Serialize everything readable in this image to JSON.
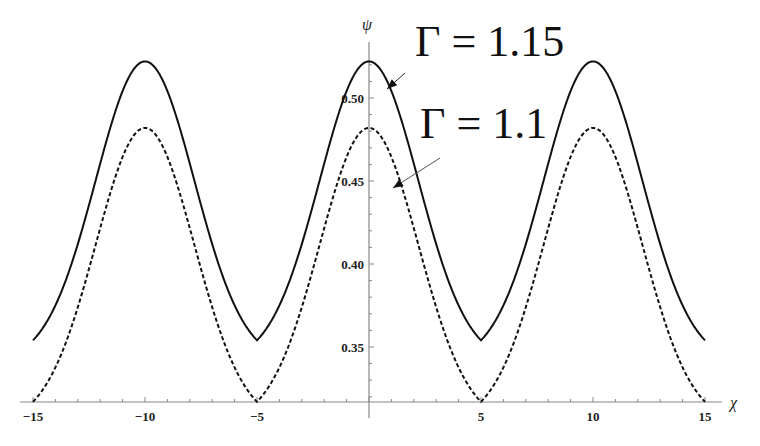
{
  "chart_data": {
    "type": "line",
    "title": "",
    "xlabel": "χ",
    "ylabel": "ψ",
    "xlim": [
      -15,
      15
    ],
    "ylim": [
      0.317,
      0.525
    ],
    "x_ticks": [
      -15,
      -10,
      -5,
      5,
      10,
      15
    ],
    "x_tick_labels": [
      "−15",
      "−10",
      "−5",
      "5",
      "10",
      "15"
    ],
    "y_ticks": [
      0.35,
      0.4,
      0.45,
      0.5
    ],
    "y_tick_labels": [
      "0.35",
      "0.40",
      "0.45",
      "0.50"
    ],
    "grid": false,
    "legend": "none (inline annotations with arrows)",
    "series": [
      {
        "name": "Γ = 1.15",
        "style": "solid",
        "period": 10,
        "peaks_at": [
          -10,
          0,
          10
        ],
        "troughs_at": [
          -15,
          -5,
          5,
          15
        ],
        "max": 0.522,
        "min": 0.354,
        "x": [
          -15,
          -12.5,
          -10,
          -7.5,
          -5,
          -2.5,
          0,
          2.5,
          5,
          7.5,
          10,
          12.5,
          15
        ],
        "values": [
          0.354,
          0.42,
          0.522,
          0.42,
          0.354,
          0.42,
          0.522,
          0.42,
          0.354,
          0.42,
          0.522,
          0.42,
          0.354
        ]
      },
      {
        "name": "Γ = 1.1",
        "style": "dashed",
        "period": 10,
        "peaks_at": [
          -10,
          0,
          10
        ],
        "troughs_at": [
          -15,
          -5,
          5,
          15
        ],
        "max": 0.482,
        "min": 0.317,
        "x": [
          -15,
          -12.5,
          -10,
          -7.5,
          -5,
          -2.5,
          0,
          2.5,
          5,
          7.5,
          10,
          12.5,
          15
        ],
        "values": [
          0.317,
          0.39,
          0.482,
          0.39,
          0.317,
          0.39,
          0.482,
          0.39,
          0.317,
          0.39,
          0.482,
          0.39,
          0.317
        ]
      }
    ],
    "annotations": [
      {
        "text": "Γ = 1.15",
        "points_to": "solid curve",
        "label_x": 415,
        "label_y": 56,
        "arrow_from": [
          405,
          73
        ],
        "arrow_to": [
          387,
          89
        ]
      },
      {
        "text": "Γ = 1.1",
        "points_to": "dashed curve",
        "label_x": 420,
        "label_y": 138,
        "arrow_from": [
          440,
          158
        ],
        "arrow_to": [
          393,
          188
        ]
      }
    ]
  }
}
